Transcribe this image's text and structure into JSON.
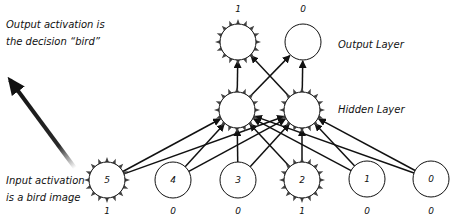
{
  "annotations": {
    "output_note": [
      "Output activation is",
      "the decision “bird”"
    ],
    "input_note": [
      "Input activation",
      "is a bird image"
    ],
    "output_layer_label": "Output Layer",
    "hidden_layer_label": "Hidden Layer"
  },
  "colors": {
    "stroke": "#111111",
    "active_spike": "#444444",
    "node_fill": "#ffffff"
  },
  "output_layer": {
    "nodes": [
      {
        "id": "out-0",
        "x": 238,
        "y": 42,
        "active": true,
        "activation": "1"
      },
      {
        "id": "out-1",
        "x": 303,
        "y": 42,
        "active": false,
        "activation": "0"
      }
    ]
  },
  "hidden_layer": {
    "nodes": [
      {
        "id": "hid-0",
        "x": 237,
        "y": 110,
        "active": true
      },
      {
        "id": "hid-1",
        "x": 302,
        "y": 110,
        "active": true
      }
    ]
  },
  "input_layer": {
    "nodes": [
      {
        "id": "in-5",
        "label": "5",
        "x": 107,
        "y": 180,
        "active": true,
        "activation": "1"
      },
      {
        "id": "in-4",
        "label": "4",
        "x": 173,
        "y": 180,
        "active": false,
        "activation": "0"
      },
      {
        "id": "in-3",
        "label": "3",
        "x": 238,
        "y": 180,
        "active": false,
        "activation": "0"
      },
      {
        "id": "in-2",
        "label": "2",
        "x": 302,
        "y": 180,
        "active": true,
        "activation": "1"
      },
      {
        "id": "in-1",
        "label": "1",
        "x": 367,
        "y": 179,
        "active": false,
        "activation": "0"
      },
      {
        "id": "in-0",
        "label": "0",
        "x": 431,
        "y": 179,
        "active": false,
        "activation": "0"
      }
    ]
  },
  "big_arrow": {
    "from": [
      75,
      168
    ],
    "to": [
      10,
      80
    ]
  }
}
